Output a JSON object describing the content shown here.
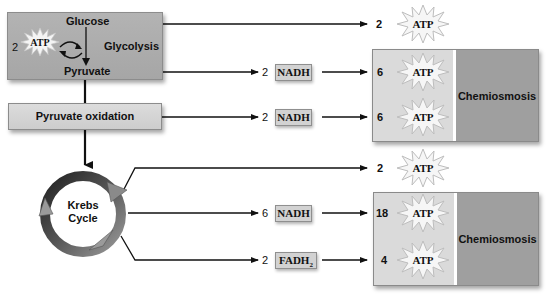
{
  "glycolysis": {
    "input": "Glucose",
    "output": "Pyruvate",
    "process": "Glycolysis",
    "invested_count": "2",
    "invested_label": "ATP"
  },
  "pyruvate_oxidation": {
    "label": "Pyruvate oxidation"
  },
  "krebs": {
    "label_line1": "Krebs",
    "label_line2": "Cycle"
  },
  "flows": [
    {
      "id": "glycolysis-atp",
      "count": "2",
      "product": "ATP"
    },
    {
      "id": "glycolysis-nadh",
      "count": "2",
      "carrier": "NADH",
      "atp_count": "6",
      "atp_label": "ATP"
    },
    {
      "id": "pyruvate-oxidation-nadh",
      "count": "2",
      "carrier": "NADH",
      "atp_count": "6",
      "atp_label": "ATP"
    },
    {
      "id": "krebs-atp",
      "count": "2",
      "product": "ATP"
    },
    {
      "id": "krebs-nadh",
      "count": "6",
      "carrier": "NADH",
      "atp_count": "18",
      "atp_label": "ATP"
    },
    {
      "id": "krebs-fadh2",
      "count": "2",
      "carrier": "FADH",
      "carrier_sub": "2",
      "atp_count": "4",
      "atp_label": "ATP"
    }
  ],
  "chemiosmosis": [
    {
      "label": "Chemiosmosis"
    },
    {
      "label": "Chemiosmosis"
    }
  ],
  "colors": {
    "glycolysis_box": "#acacac",
    "pyruvate_oxidation_box": "#d4d4d4",
    "chemiosmosis_left": "#dadada",
    "chemiosmosis_right": "#9f9f9f",
    "carrier_box": "#d2d2d2",
    "arrow": "#111111"
  }
}
